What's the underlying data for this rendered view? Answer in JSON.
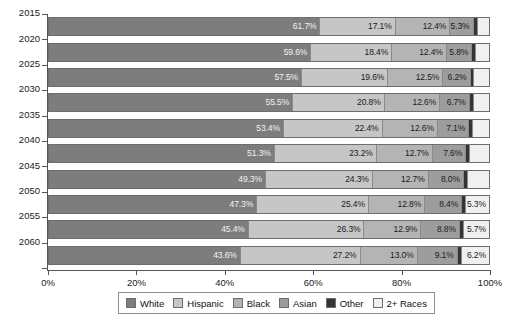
{
  "chart_data": {
    "type": "bar",
    "orientation": "horizontal",
    "stacked": true,
    "normalized_percent": true,
    "title": "",
    "subtitle": "",
    "xlabel": "",
    "ylabel": "",
    "xlim": [
      0,
      100
    ],
    "xticks": [
      "0%",
      "20%",
      "40%",
      "60%",
      "80%",
      "100%"
    ],
    "xtick_values": [
      0,
      20,
      40,
      60,
      80,
      100
    ],
    "grid": false,
    "legend_position": "bottom",
    "categories": [
      "2015",
      "2020",
      "2025",
      "2030",
      "2035",
      "2040",
      "2045",
      "2050",
      "2055",
      "2060"
    ],
    "series": [
      {
        "name": "White",
        "color": "#7d7d7d",
        "values": [
          61.7,
          59.6,
          57.5,
          55.5,
          53.4,
          51.3,
          49.3,
          47.3,
          45.4,
          43.6
        ],
        "labels": [
          "61.7%",
          "59.6%",
          "57.5%",
          "55.5%",
          "53.4%",
          "51.3%",
          "49.3%",
          "47.3%",
          "45.4%",
          "43.6%"
        ]
      },
      {
        "name": "Hispanic",
        "color": "#c6c6c6",
        "values": [
          17.1,
          18.4,
          19.6,
          20.8,
          22.4,
          23.2,
          24.3,
          25.4,
          26.3,
          27.2
        ],
        "labels": [
          "17.1%",
          "18.4%",
          "19.6%",
          "20.8%",
          "22.4%",
          "23.2%",
          "24.3%",
          "25.4%",
          "26.3%",
          "27.2%"
        ]
      },
      {
        "name": "Black",
        "color": "#b4b4b4",
        "values": [
          12.4,
          12.4,
          12.5,
          12.6,
          12.6,
          12.7,
          12.7,
          12.8,
          12.9,
          13.0
        ],
        "labels": [
          "12.4%",
          "12.4%",
          "12.5%",
          "12.6%",
          "12.6%",
          "12.7%",
          "12.7%",
          "12.8%",
          "12.9%",
          "13.0%"
        ]
      },
      {
        "name": "Asian",
        "color": "#9d9d9d",
        "values": [
          5.3,
          5.8,
          6.2,
          6.7,
          7.1,
          7.6,
          8.0,
          8.4,
          8.8,
          9.1
        ],
        "labels": [
          "5.3%",
          "5.8%",
          "6.2%",
          "6.7%",
          "7.1%",
          "7.6%",
          "8.0%",
          "8.4%",
          "8.8%",
          "9.1%"
        ]
      },
      {
        "name": "Other",
        "color": "#343434",
        "values": [
          0.9,
          0.9,
          0.9,
          0.9,
          0.9,
          0.9,
          0.9,
          0.8,
          0.9,
          0.9
        ],
        "labels": [
          "",
          "",
          "",
          "",
          "",
          "",
          "",
          "",
          "",
          ""
        ]
      },
      {
        "name": "2+ Races",
        "color": "#f0f0f0",
        "values": [
          2.6,
          2.9,
          3.3,
          3.5,
          3.6,
          4.3,
          4.8,
          5.3,
          5.7,
          6.2
        ],
        "labels": [
          "",
          "",
          "",
          "",
          "",
          "",
          "",
          "5.3%",
          "5.7%",
          "6.2%"
        ]
      }
    ]
  },
  "legend": {
    "items": [
      {
        "label": "White",
        "color": "#7d7d7d"
      },
      {
        "label": "Hispanic",
        "color": "#c6c6c6"
      },
      {
        "label": "Black",
        "color": "#b4b4b4"
      },
      {
        "label": "Asian",
        "color": "#9d9d9d"
      },
      {
        "label": "Other",
        "color": "#343434"
      },
      {
        "label": "2+ Races",
        "color": "#f0f0f0"
      }
    ]
  }
}
